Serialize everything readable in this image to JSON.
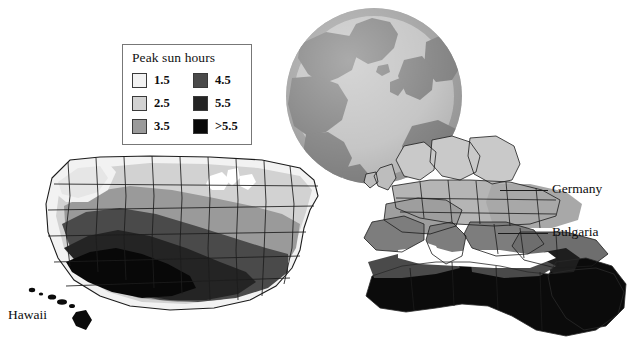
{
  "figure": {
    "width": 629,
    "height": 364,
    "background": "#ffffff"
  },
  "legend": {
    "title": "Peak sun hours",
    "border_color": "#777777",
    "background": "#ffffff",
    "items": [
      {
        "label": "1.5",
        "color": "#f2f2f2",
        "column": "left",
        "row": 1
      },
      {
        "label": "2.5",
        "color": "#d2d2d2",
        "column": "left",
        "row": 2
      },
      {
        "label": "3.5",
        "color": "#9a9a9a",
        "column": "left",
        "row": 3
      },
      {
        "label": "4.5",
        "color": "#4a4a4a",
        "column": "right",
        "row": 1
      },
      {
        "label": "5.5",
        "color": "#242424",
        "column": "right",
        "row": 2
      },
      {
        "label": ">5.5",
        "color": "#080808",
        "column": "right",
        "row": 3
      }
    ]
  },
  "callouts": [
    {
      "name": "germany",
      "label": "Germany",
      "label_x": 552,
      "label_y": 181,
      "leader_x": 500,
      "leader_y": 190,
      "leader_w": 48
    },
    {
      "name": "bulgaria",
      "label": "Bulgaria",
      "label_x": 552,
      "label_y": 224,
      "leader_x": 498,
      "leader_y": 233,
      "leader_w": 50
    },
    {
      "name": "hawaii",
      "label": "Hawaii",
      "label_x": 8,
      "label_y": 307,
      "leader_x": 0,
      "leader_y": 0,
      "leader_w": 0
    }
  ],
  "globe": {
    "name": "north-atlantic-globe",
    "center_x": 374,
    "center_y": 96,
    "radius": 88,
    "ocean_color": "#c9c9c9",
    "land_color": "#8d8d8d"
  },
  "palette": {
    "band_1_5": "#f2f2f2",
    "band_2_5": "#d2d2d2",
    "band_3_5": "#9a9a9a",
    "band_4_5": "#4a4a4a",
    "band_5_5": "#242424",
    "band_gt_5_5": "#080808",
    "outline": "#1c1c1c",
    "paper": "#ffffff"
  }
}
